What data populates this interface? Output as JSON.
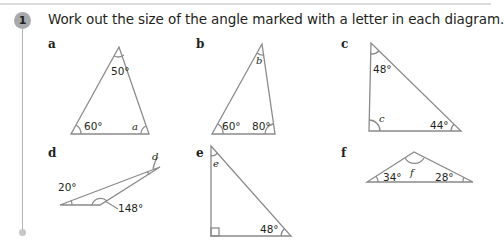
{
  "question": {
    "number": "1",
    "text": "Work out the size of the angle marked with a letter in each diagram."
  },
  "parts": [
    {
      "label": "a",
      "angles": [
        "50°",
        "60°"
      ],
      "unknown": "a"
    },
    {
      "label": "b",
      "angles": [
        "60°",
        "80°"
      ],
      "unknown": "b"
    },
    {
      "label": "c",
      "angles": [
        "48°",
        "44°"
      ],
      "unknown": "c"
    },
    {
      "label": "d",
      "angles": [
        "20°",
        "148°"
      ],
      "unknown": "d"
    },
    {
      "label": "e",
      "angles": [
        "48°"
      ],
      "unknown": "e",
      "right_angle": true
    },
    {
      "label": "f",
      "angles": [
        "34°",
        "28°"
      ],
      "unknown": "f"
    }
  ],
  "colors": {
    "line": "#8a8a8a",
    "badge": "#a7a9ac",
    "text": "#231f20"
  }
}
